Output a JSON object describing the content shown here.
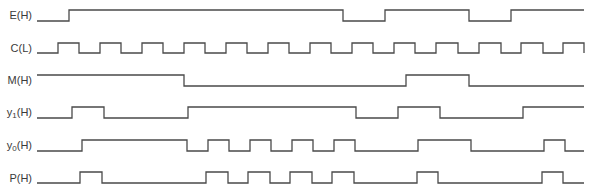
{
  "diagram": {
    "title": "",
    "x_start": 37,
    "x_end": 584,
    "line_color": "#4a4a4a",
    "signals": [
      {
        "name": "E",
        "active": "H",
        "label": "E(H)",
        "high_y": 10,
        "low_y": 21,
        "initial": 0,
        "transitions": [
          69,
          343,
          385,
          469,
          511
        ]
      },
      {
        "name": "C",
        "active": "L",
        "label": "C(L)",
        "high_y": 43,
        "low_y": 53,
        "initial": 0,
        "transitions": [
          58,
          79,
          100,
          121,
          142,
          163,
          184,
          205,
          226,
          247,
          268,
          289,
          310,
          331,
          352,
          373,
          394,
          415,
          436,
          458,
          479,
          501,
          521,
          543,
          563,
          584
        ]
      },
      {
        "name": "M",
        "active": "H",
        "label": "M(H)",
        "high_y": 75,
        "low_y": 86,
        "initial": 1,
        "transitions": [
          184,
          406,
          469
        ]
      },
      {
        "name": "y1",
        "active": "H",
        "label_main": "y",
        "label_sub": "1",
        "label_suffix": "(H)",
        "high_y": 107,
        "low_y": 118,
        "initial": 0,
        "transitions": [
          72,
          104,
          188,
          356,
          398,
          440,
          523
        ]
      },
      {
        "name": "y0",
        "active": "H",
        "label_main": "y",
        "label_sub": "0",
        "label_suffix": "(H)",
        "high_y": 140,
        "low_y": 151,
        "initial": 0,
        "transitions": [
          82,
          187,
          208,
          229,
          250,
          271,
          292,
          313,
          334,
          355,
          418,
          471,
          544,
          565
        ]
      },
      {
        "name": "P",
        "active": "H",
        "label": "P(H)",
        "high_y": 172,
        "low_y": 183,
        "initial": 0,
        "transitions": [
          80,
          102,
          206,
          228,
          248,
          270,
          290,
          312,
          332,
          354,
          417,
          438,
          542,
          563
        ]
      }
    ]
  }
}
